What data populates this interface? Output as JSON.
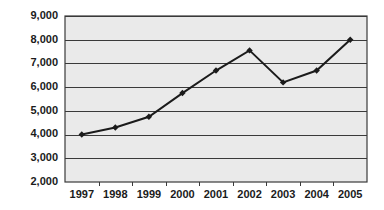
{
  "chart_data": {
    "type": "line",
    "title": "",
    "subtitle": "",
    "xlabel": "",
    "ylabel": "",
    "categories": [
      "1997",
      "1998",
      "1999",
      "2000",
      "2001",
      "2002",
      "2003",
      "2004",
      "2005"
    ],
    "values": [
      4000,
      4300,
      4750,
      5750,
      6700,
      7550,
      6200,
      6700,
      8000
    ],
    "series": [
      {
        "name": "series-1",
        "values": [
          4000,
          4300,
          4750,
          5750,
          6700,
          7550,
          6200,
          6700,
          8000
        ],
        "line_color": "#1b1b1b",
        "marker": "diamond",
        "marker_color": "#1b1b1b"
      }
    ],
    "ylim": [
      2000,
      9000
    ],
    "ytick_values": [
      2000,
      3000,
      4000,
      5000,
      6000,
      7000,
      8000,
      9000
    ],
    "ytick_labels": [
      "2,000",
      "3,000",
      "4,000",
      "5,000",
      "6,000",
      "7,000",
      "8,000",
      "9,000"
    ],
    "xtick_labels": [
      "1997",
      "1998",
      "1999",
      "2000",
      "2001",
      "2002",
      "2003",
      "2004",
      "2005"
    ],
    "grid": true,
    "grid_axis": "y",
    "legend": false,
    "legend_position": "none",
    "plot_background": "#eaeaea",
    "figure_background": "#ffffff",
    "frame_color": "#3a3a3a",
    "gridline_color": "#3a3a3a",
    "annotations": []
  }
}
